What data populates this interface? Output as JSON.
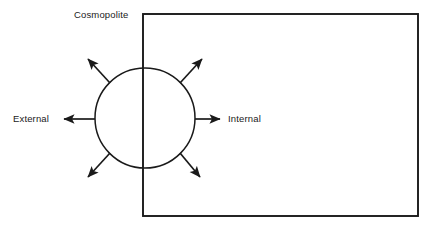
{
  "diagram": {
    "title_label": "Cosmopolite",
    "left_label": "External",
    "right_label": "Internal",
    "stroke_color": "#1a1a1a",
    "background_color": "#ffffff",
    "shapes": {
      "boundary_rectangle": {
        "name": "organization-boundary-rectangle",
        "x": 143,
        "y": 14,
        "width": 275,
        "height": 202
      },
      "node_circle": {
        "name": "cosmopolite-circle",
        "cx": 145,
        "cy": 118,
        "r": 50
      }
    },
    "arrows": [
      {
        "name": "arrow-left-external",
        "direction": "left",
        "x1": 95,
        "y1": 119,
        "x2": 62,
        "y2": 119
      },
      {
        "name": "arrow-right-internal",
        "direction": "right",
        "x1": 195,
        "y1": 119,
        "x2": 222,
        "y2": 119
      },
      {
        "name": "arrow-upper-left",
        "direction": "upper-left",
        "x1": 110,
        "y1": 83,
        "x2": 86,
        "y2": 57
      },
      {
        "name": "arrow-upper-right",
        "direction": "upper-right",
        "x1": 180,
        "y1": 83,
        "x2": 204,
        "y2": 57
      },
      {
        "name": "arrow-lower-left",
        "direction": "lower-left",
        "x1": 110,
        "y1": 153,
        "x2": 86,
        "y2": 179
      },
      {
        "name": "arrow-lower-right",
        "direction": "lower-right",
        "x1": 180,
        "y1": 153,
        "x2": 202,
        "y2": 179
      }
    ]
  }
}
